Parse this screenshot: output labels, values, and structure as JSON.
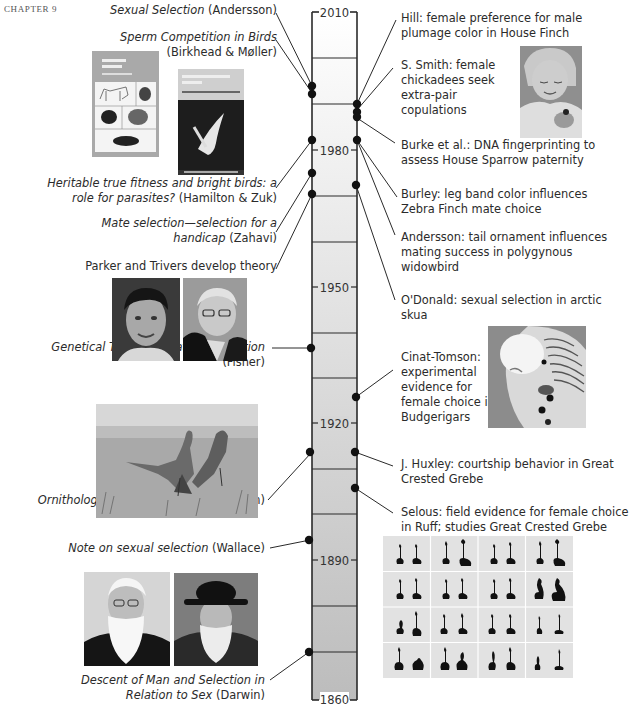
{
  "chapter": "CHAPTER 9",
  "timeline": {
    "years": [
      "2010",
      "1980",
      "1950",
      "1920",
      "1890",
      "1860"
    ],
    "gradient_top": "#ffffff",
    "gradient_bottom": "#bdbdbd",
    "line_color": "#2a2a2a"
  },
  "left_events": [
    {
      "title": "Sexual Selection",
      "author": "(Andersson)"
    },
    {
      "title": "Sperm Competition in Birds",
      "author": "(Birkhead & Møller)"
    },
    {
      "title_line1": "Heritable true fitness and bright birds: a",
      "title_line2": "role for parasites?",
      "author": "(Hamilton & Zuk)"
    },
    {
      "title_line1": "Mate selection—selection for a",
      "title_line2": "handicap",
      "author": "(Zahavi)"
    },
    {
      "text": "Parker and Trivers develop theory"
    },
    {
      "title": "Genetical Theory of Natural Selection",
      "author": "(Fisher)"
    },
    {
      "title": "Ornithological and Other Oddities",
      "author": "(Finn)"
    },
    {
      "title": "Note on sexual selection",
      "author": "(Wallace)"
    },
    {
      "title_line1": "Descent of Man and Selection in",
      "title_line2": "Relation to Sex",
      "author": "(Darwin)"
    }
  ],
  "right_events": [
    {
      "line1": "Hill: female preference for male",
      "line2": "plumage color in House Finch"
    },
    {
      "line1": "S. Smith: female",
      "line2": "chickadees seek",
      "line3": "extra-pair",
      "line4": "copulations"
    },
    {
      "line1": "Burke et al.: DNA fingerprinting to",
      "line2": "assess House Sparrow paternity"
    },
    {
      "line1": "Burley: leg band color influences",
      "line2": "Zebra Finch mate choice"
    },
    {
      "line1": "Andersson: tail ornament influences",
      "line2": "mating success in polygynous",
      "line3": "widowbird"
    },
    {
      "line1": "O'Donald: sexual selection in arctic",
      "line2": "skua"
    },
    {
      "line1": "Cinat-Tomson:",
      "line2": "experimental",
      "line3": "evidence for",
      "line4": "female choice in",
      "line5": "Budgerigars"
    },
    {
      "line1": "J. Huxley: courtship behavior in Great",
      "line2": "Crested Grebe"
    },
    {
      "line1": "Selous: field evidence for female choice",
      "line2": "in Ruff; studies Great Crested Grebe"
    }
  ],
  "images": {
    "book1_title": "Sexual Selection",
    "book2_title": "Sperm Competition in Birds"
  }
}
